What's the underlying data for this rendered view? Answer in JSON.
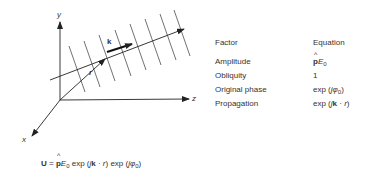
{
  "diagram": {
    "axes": {
      "y_label": "y",
      "z_label": "z",
      "x_label": "x"
    },
    "vectors": {
      "r_label": "r",
      "k_label": "k"
    },
    "wavefront_count": 8
  },
  "table": {
    "headers": {
      "factor": "Factor",
      "equation": "Equation"
    },
    "rows": [
      {
        "factor": "Amplitude",
        "eq_main": "p",
        "eq_rest": "E",
        "eq_sub": "0",
        "eq_tail": ""
      },
      {
        "factor": "Obliquity",
        "eq_text": "1"
      },
      {
        "factor": "Original phase",
        "eq_pre": "exp (",
        "eq_j": "j",
        "eq_phi": "φ",
        "eq_sub": "0",
        "eq_post": ")"
      },
      {
        "factor": "Propagation",
        "eq_pre": "exp (",
        "eq_j": "j",
        "eq_k": "k",
        "eq_mid": " · ",
        "eq_r": "r",
        "eq_post": ")"
      }
    ]
  },
  "equation": {
    "U": "U",
    "equals": " = ",
    "p": "p",
    "E": "E",
    "E_sub": "0",
    "exp1_pre": " exp (",
    "j1": "j",
    "k": "k",
    "dot": " · ",
    "r": "r",
    "exp1_post": ") exp (",
    "j2": "j",
    "phi": "φ",
    "phi_sub": "0",
    "exp2_post": ")"
  }
}
